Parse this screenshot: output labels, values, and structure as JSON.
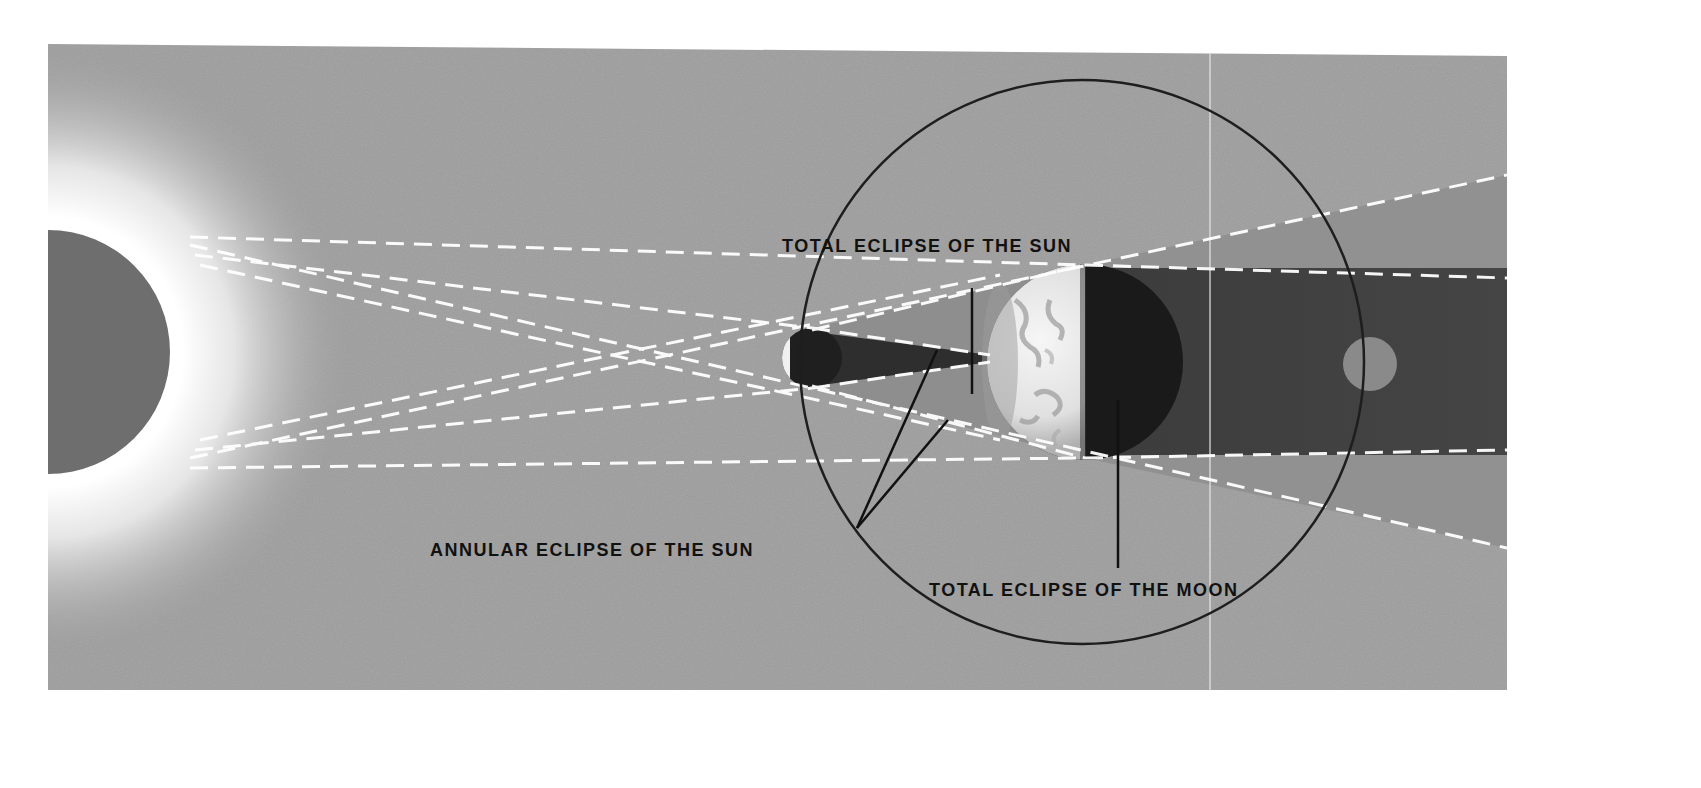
{
  "diagram": {
    "colors": {
      "page_background": "#ffffff",
      "panel_background": "#a7a7a7",
      "sun": "#6e6e6e",
      "corona": "#ffffff",
      "orbit_line": "#222222",
      "umbra": "#4a4a4a",
      "penumbra": "#8f8f8f",
      "earth_lit": "#eeeeee",
      "earth_dark": "#1a1a1a",
      "moon_in_shadow": "#8a8a8a",
      "dashed_ray": "#ffffff",
      "label_text": "#111111"
    },
    "labels": {
      "total_solar": "TOTAL ECLIPSE OF THE SUN",
      "annular_solar": "ANNULAR ECLIPSE OF THE SUN",
      "total_lunar": "TOTAL ECLIPSE OF THE MOON"
    },
    "bodies": [
      {
        "name": "Sun",
        "cx": 48,
        "cy": 352,
        "r": 122
      },
      {
        "name": "Moon (annular position)",
        "cx": 812,
        "cy": 358,
        "r": 30
      },
      {
        "name": "Earth",
        "cx": 1085,
        "cy": 362,
        "r": 98
      },
      {
        "name": "Moon (in Earth's shadow)",
        "cx": 1370,
        "cy": 364,
        "r": 27
      }
    ],
    "moon_orbit": {
      "cx": 1082,
      "cy": 362,
      "r": 282
    }
  }
}
